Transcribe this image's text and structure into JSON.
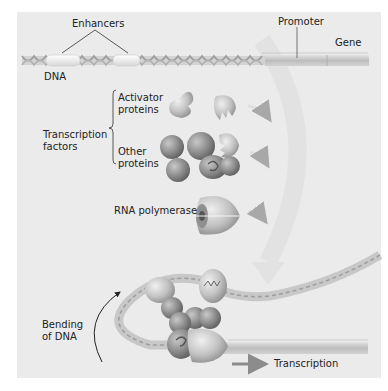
{
  "labels": {
    "enhancers": "Enhancers",
    "promoter": "Promoter",
    "gene": "Gene",
    "dna": "DNA",
    "transcription_factors": [
      "Transcription",
      "factors"
    ],
    "activator_proteins": [
      "Activator",
      "proteins"
    ],
    "other_proteins": [
      "Other",
      "proteins"
    ],
    "rna_polymerase": "RNA polymerase",
    "bending_of_dna": [
      "Bending",
      "of DNA"
    ],
    "transcription": "Transcription"
  },
  "colors": {
    "background": "#ebebeb",
    "dna_helix": "#b5b5b5",
    "enhancer": "#f7f7f7",
    "gene_bar": "#c4c4c4",
    "protein": "#8a8a8a",
    "arrow": "#8c8c8c",
    "faded_arrow": "#dddddd"
  }
}
